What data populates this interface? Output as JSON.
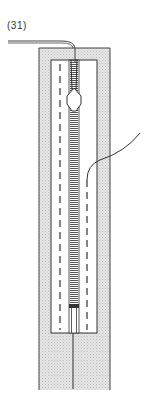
{
  "figure": {
    "step_label": "(31)",
    "elements": {
      "fabric_panel": "outer stippled fabric strip",
      "opening": "inner rectangular opening",
      "zipper": "zipper tape with teeth",
      "zipper_pull": "zipper slider",
      "thread_top": "thread leading off to left",
      "thread_right": "thread curving off to upper right",
      "stitch_lines": "dashed stitching lines"
    },
    "colors": {
      "line": "#333333",
      "stipple": "#d9d9d9",
      "background": "#ffffff"
    }
  }
}
